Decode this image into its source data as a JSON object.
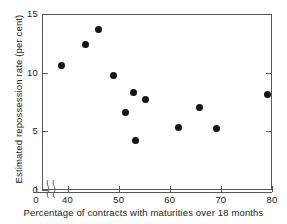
{
  "chart_data": {
    "type": "scatter",
    "title": "",
    "xlabel": "Percentage of contracts with maturities over 18 months",
    "ylabel": "Estimated repossession rate (per cent)",
    "xlim": [
      35,
      80
    ],
    "ylim": [
      0,
      15
    ],
    "grid": false,
    "legend": null,
    "x_ticks": [
      0,
      40,
      50,
      60,
      70,
      80
    ],
    "x_tick_labels": [
      "0",
      "40",
      "50",
      "60",
      "70",
      "80"
    ],
    "y_ticks": [
      0,
      5,
      10,
      15
    ],
    "y_tick_labels": [
      "0",
      "5",
      "10",
      "15"
    ],
    "axis_break": "x-axis broken between 0 and 35",
    "marker": "filled-circle",
    "marker_color": "#151515",
    "points": [
      {
        "x": 38.9,
        "y": 10.6
      },
      {
        "x": 43.6,
        "y": 12.4
      },
      {
        "x": 46.0,
        "y": 13.7
      },
      {
        "x": 49.0,
        "y": 9.8
      },
      {
        "x": 51.4,
        "y": 6.6
      },
      {
        "x": 52.9,
        "y": 8.3
      },
      {
        "x": 53.2,
        "y": 4.2
      },
      {
        "x": 55.3,
        "y": 7.7
      },
      {
        "x": 61.8,
        "y": 5.3
      },
      {
        "x": 65.9,
        "y": 7.0
      },
      {
        "x": 69.2,
        "y": 5.2
      },
      {
        "x": 79.2,
        "y": 8.1
      }
    ]
  },
  "axes": {
    "x_label": "Percentage of contracts with maturities over 18 months",
    "y_label": "Estimated repossession rate (per cent)",
    "x_tick_labels": [
      "0",
      "40",
      "50",
      "60",
      "70",
      "80"
    ],
    "y_tick_labels": [
      "0",
      "5",
      "10",
      "15"
    ]
  },
  "colors": {
    "marker": "#151515",
    "axis": "#58585a",
    "background": "#ffffff",
    "text": "#1a1a1a"
  }
}
